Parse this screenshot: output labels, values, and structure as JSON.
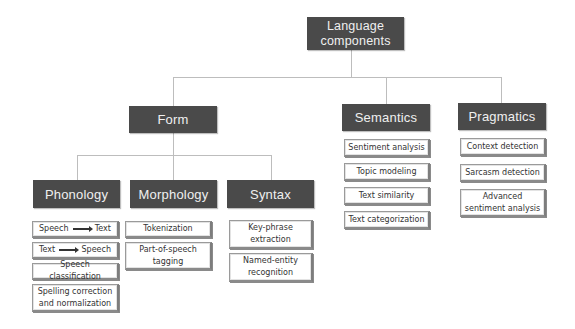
{
  "root": {
    "label": "Language components"
  },
  "level1": [
    {
      "label": "Form"
    },
    {
      "label": "Semantics"
    },
    {
      "label": "Pragmatics"
    }
  ],
  "form_children": [
    {
      "label": "Phonology"
    },
    {
      "label": "Morphology"
    },
    {
      "label": "Syntax"
    }
  ],
  "phonology_items": [
    {
      "from": "Speech",
      "to": "Text",
      "arrow": "right-arrow-icon"
    },
    {
      "from": "Text",
      "to": "Speech",
      "arrow": "right-arrow-icon"
    },
    {
      "label": "Speech classification"
    },
    {
      "label": "Spelling correction and normalization"
    }
  ],
  "morphology_items": [
    {
      "label": "Tokenization"
    },
    {
      "label": "Part-of-speech tagging"
    }
  ],
  "syntax_items": [
    {
      "label": "Key-phrase extraction"
    },
    {
      "label": "Named-entity recognition"
    }
  ],
  "semantics_items": [
    {
      "label": "Sentiment analysis"
    },
    {
      "label": "Topic modeling"
    },
    {
      "label": "Text similarity"
    },
    {
      "label": "Text categorization"
    }
  ],
  "pragmatics_items": [
    {
      "label": "Context detection"
    },
    {
      "label": "Sarcasm detection"
    },
    {
      "label": "Advanced sentiment analysis"
    }
  ],
  "colors": {
    "header_bg": "#4a4a4a",
    "header_text": "#f0f0f0",
    "connector": "#bdbdbd",
    "leaf_border": "#9a9a9a"
  }
}
